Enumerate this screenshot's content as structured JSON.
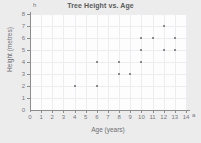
{
  "chart_data": {
    "type": "scatter",
    "title": "Tree Height vs. Age",
    "xlabel": "Age (years)",
    "ylabel": "Height (metres)",
    "x_axis_symbol": "a",
    "y_axis_symbol": "h",
    "xlim": [
      0,
      14
    ],
    "ylim": [
      0,
      8
    ],
    "xticks": [
      0,
      1,
      2,
      3,
      4,
      5,
      6,
      7,
      8,
      9,
      10,
      11,
      12,
      13,
      14
    ],
    "yticks": [
      0,
      1,
      2,
      3,
      4,
      5,
      6,
      7,
      8
    ],
    "grid": true,
    "legend": null,
    "marker_color": "#8a8a8e",
    "plot_background": "#fdfdfd",
    "figure_background": "#ececed",
    "points": [
      {
        "x": 4,
        "y": 2
      },
      {
        "x": 6,
        "y": 2
      },
      {
        "x": 6,
        "y": 4
      },
      {
        "x": 8,
        "y": 3
      },
      {
        "x": 8,
        "y": 4
      },
      {
        "x": 9,
        "y": 3
      },
      {
        "x": 10,
        "y": 4
      },
      {
        "x": 10,
        "y": 5
      },
      {
        "x": 10,
        "y": 6
      },
      {
        "x": 11,
        "y": 6
      },
      {
        "x": 12,
        "y": 5
      },
      {
        "x": 12,
        "y": 7
      },
      {
        "x": 13,
        "y": 5
      },
      {
        "x": 13,
        "y": 6
      }
    ]
  }
}
